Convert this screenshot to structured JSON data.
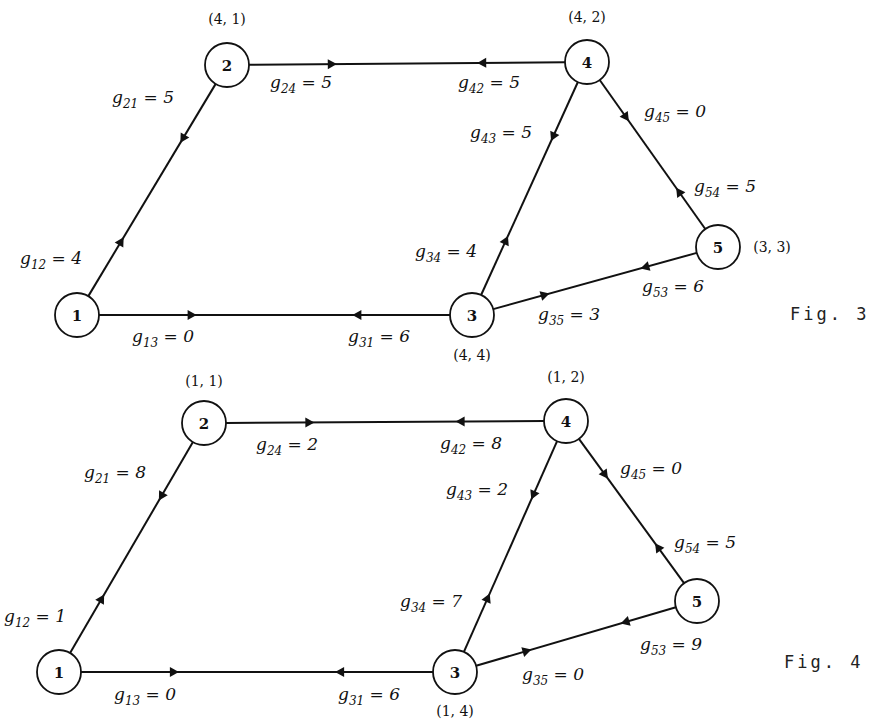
{
  "figures": [
    {
      "caption": "Fig. 3",
      "nodes": [
        {
          "id": "1",
          "label": "1",
          "x": 77,
          "y": 315,
          "coord": ""
        },
        {
          "id": "2",
          "label": "2",
          "x": 227,
          "y": 65,
          "coord": "(4, 1)",
          "cx": 227,
          "cy": 24
        },
        {
          "id": "3",
          "label": "3",
          "x": 472,
          "y": 315,
          "coord": "(4, 4)",
          "cx": 472,
          "cy": 360
        },
        {
          "id": "4",
          "label": "4",
          "x": 587,
          "y": 62,
          "coord": "(4, 2)",
          "cx": 587,
          "cy": 22
        },
        {
          "id": "5",
          "label": "5",
          "x": 718,
          "y": 247,
          "coord": "(3, 3)",
          "cx": 772,
          "cy": 252
        }
      ],
      "edges": [
        {
          "from": "1",
          "to": "2",
          "name": "g12",
          "base": "g",
          "sub": "12",
          "value": "4",
          "lx": 20,
          "ly": 264
        },
        {
          "from": "2",
          "to": "1",
          "name": "g21",
          "base": "g",
          "sub": "21",
          "value": "5",
          "lx": 112,
          "ly": 103
        },
        {
          "from": "1",
          "to": "3",
          "name": "g13",
          "base": "g",
          "sub": "13",
          "value": "0",
          "lx": 132,
          "ly": 342
        },
        {
          "from": "3",
          "to": "1",
          "name": "g31",
          "base": "g",
          "sub": "31",
          "value": "6",
          "lx": 348,
          "ly": 342
        },
        {
          "from": "2",
          "to": "4",
          "name": "g24",
          "base": "g",
          "sub": "24",
          "value": "5",
          "lx": 270,
          "ly": 88
        },
        {
          "from": "4",
          "to": "2",
          "name": "g42",
          "base": "g",
          "sub": "42",
          "value": "5",
          "lx": 458,
          "ly": 88
        },
        {
          "from": "4",
          "to": "3",
          "name": "g43",
          "base": "g",
          "sub": "43",
          "value": "5",
          "lx": 470,
          "ly": 138
        },
        {
          "from": "3",
          "to": "4",
          "name": "g34",
          "base": "g",
          "sub": "34",
          "value": "4",
          "lx": 415,
          "ly": 257
        },
        {
          "from": "4",
          "to": "5",
          "name": "g45",
          "base": "g",
          "sub": "45",
          "value": "0",
          "lx": 644,
          "ly": 117
        },
        {
          "from": "5",
          "to": "4",
          "name": "g54",
          "base": "g",
          "sub": "54",
          "value": "5",
          "lx": 694,
          "ly": 192
        },
        {
          "from": "3",
          "to": "5",
          "name": "g35",
          "base": "g",
          "sub": "35",
          "value": "3",
          "lx": 538,
          "ly": 320
        },
        {
          "from": "5",
          "to": "3",
          "name": "g53",
          "base": "g",
          "sub": "53",
          "value": "6",
          "lx": 642,
          "ly": 292
        }
      ],
      "caption_x": 790,
      "caption_y": 320
    },
    {
      "caption": "Fig. 4",
      "nodes": [
        {
          "id": "1",
          "label": "1",
          "x": 59,
          "y": 672,
          "coord": ""
        },
        {
          "id": "2",
          "label": "2",
          "x": 204,
          "y": 423,
          "coord": "(1, 1)",
          "cx": 204,
          "cy": 386
        },
        {
          "id": "3",
          "label": "3",
          "x": 455,
          "y": 672,
          "coord": "(1, 4)",
          "cx": 455,
          "cy": 716
        },
        {
          "id": "4",
          "label": "4",
          "x": 566,
          "y": 421,
          "coord": "(1, 2)",
          "cx": 566,
          "cy": 382
        },
        {
          "id": "5",
          "label": "5",
          "x": 697,
          "y": 601,
          "coord": "",
          "cx": 0,
          "cy": 0
        }
      ],
      "edges": [
        {
          "from": "1",
          "to": "2",
          "name": "g12",
          "base": "g",
          "sub": "12",
          "value": "1",
          "lx": 4,
          "ly": 622
        },
        {
          "from": "2",
          "to": "1",
          "name": "g21",
          "base": "g",
          "sub": "21",
          "value": "8",
          "lx": 84,
          "ly": 478
        },
        {
          "from": "1",
          "to": "3",
          "name": "g13",
          "base": "g",
          "sub": "13",
          "value": "0",
          "lx": 114,
          "ly": 700
        },
        {
          "from": "3",
          "to": "1",
          "name": "g31",
          "base": "g",
          "sub": "31",
          "value": "6",
          "lx": 338,
          "ly": 700
        },
        {
          "from": "2",
          "to": "4",
          "name": "g24",
          "base": "g",
          "sub": "24",
          "value": "2",
          "lx": 256,
          "ly": 450
        },
        {
          "from": "4",
          "to": "2",
          "name": "g42",
          "base": "g",
          "sub": "42",
          "value": "8",
          "lx": 440,
          "ly": 449
        },
        {
          "from": "4",
          "to": "3",
          "name": "g43",
          "base": "g",
          "sub": "43",
          "value": "2",
          "lx": 446,
          "ly": 495
        },
        {
          "from": "3",
          "to": "4",
          "name": "g34",
          "base": "g",
          "sub": "34",
          "value": "7",
          "lx": 400,
          "ly": 607
        },
        {
          "from": "4",
          "to": "5",
          "name": "g45",
          "base": "g",
          "sub": "45",
          "value": "0",
          "lx": 620,
          "ly": 474
        },
        {
          "from": "5",
          "to": "4",
          "name": "g54",
          "base": "g",
          "sub": "54",
          "value": "5",
          "lx": 674,
          "ly": 548
        },
        {
          "from": "3",
          "to": "5",
          "name": "g35",
          "base": "g",
          "sub": "35",
          "value": "0",
          "lx": 522,
          "ly": 680
        },
        {
          "from": "5",
          "to": "3",
          "name": "g53",
          "base": "g",
          "sub": "53",
          "value": "9",
          "lx": 640,
          "ly": 650
        }
      ],
      "caption_x": 784,
      "caption_y": 668
    }
  ],
  "node_radius": 22,
  "colors": {
    "ink": "#111111",
    "background": "#ffffff"
  }
}
